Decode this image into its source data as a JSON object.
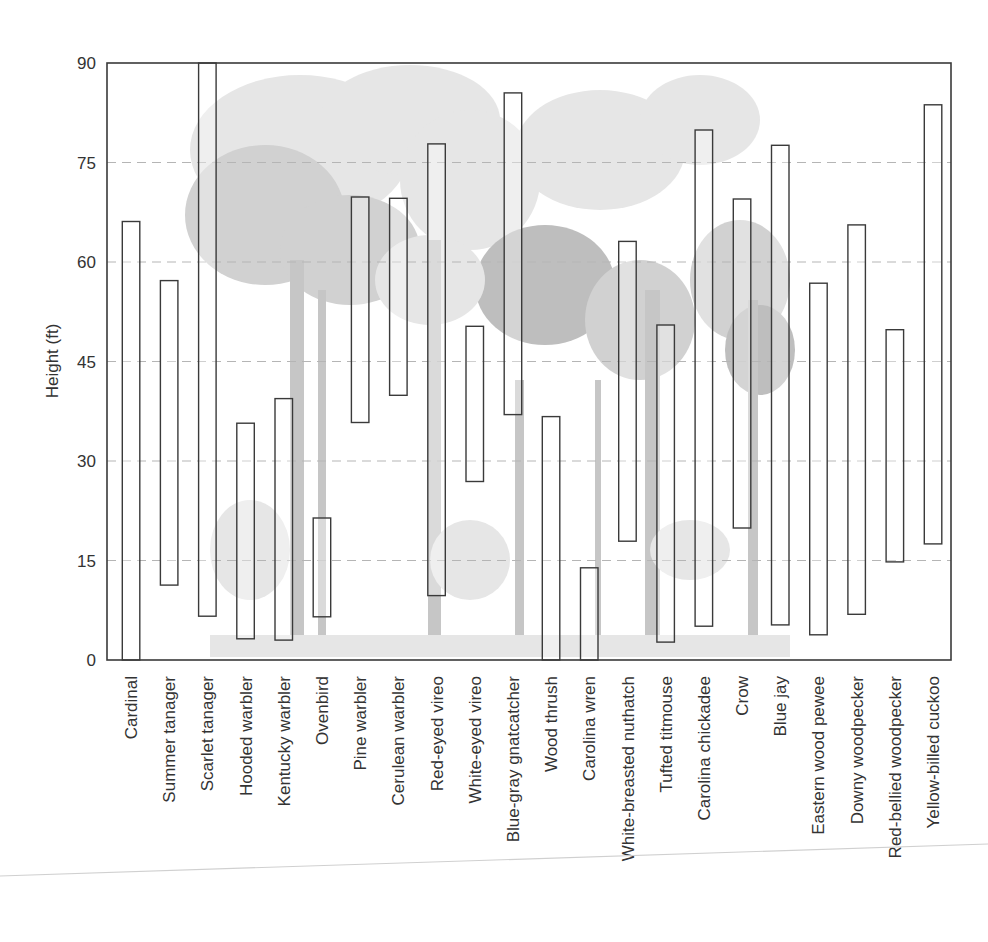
{
  "chart_data": {
    "type": "bar",
    "subtype": "floating-range",
    "title": "",
    "xlabel": "",
    "ylabel": "Height (ft)",
    "ylim": [
      0,
      90
    ],
    "yticks": [
      0,
      15,
      30,
      45,
      60,
      75,
      90
    ],
    "grid": {
      "horizontal_dashed": [
        15,
        30,
        45,
        60,
        75
      ]
    },
    "legend": null,
    "background": "illustration of forest trees (grayscale)",
    "categories": [
      "Cardinal",
      "Summer tanager",
      "Scarlet tanager",
      "Hooded warbler",
      "Kentucky warbler",
      "Ovenbird",
      "Pine warbler",
      "Cerulean warbler",
      "Red-eyed vireo",
      "White-eyed vireo",
      "Blue-gray gnatcatcher",
      "Wood thrush",
      "Carolina wren",
      "White-breasted nuthatch",
      "Tufted titmouse",
      "Carolina chickadee",
      "Crow",
      "Blue jay",
      "Eastern wood pewee",
      "Downy woodpecker",
      "Red-bellied woodpecker",
      "Yellow-billed cuckoo"
    ],
    "series": [
      {
        "name": "low",
        "values": [
          0,
          11.3,
          6.6,
          3.2,
          3.0,
          6.5,
          35.8,
          39.9,
          9.7,
          26.9,
          37.0,
          0,
          0,
          17.9,
          2.7,
          5.1,
          19.9,
          5.3,
          3.8,
          6.9,
          14.8,
          17.5
        ]
      },
      {
        "name": "high",
        "values": [
          66.1,
          57.2,
          90,
          35.7,
          39.4,
          21.4,
          69.8,
          69.6,
          77.8,
          50.3,
          85.5,
          36.7,
          13.9,
          63.1,
          50.5,
          79.9,
          69.5,
          77.6,
          56.8,
          65.6,
          49.8,
          83.7
        ]
      }
    ]
  },
  "axis": {
    "ylabel": "Height (ft)",
    "ytick_labels": [
      "0",
      "15",
      "30",
      "45",
      "60",
      "75",
      "90"
    ]
  }
}
